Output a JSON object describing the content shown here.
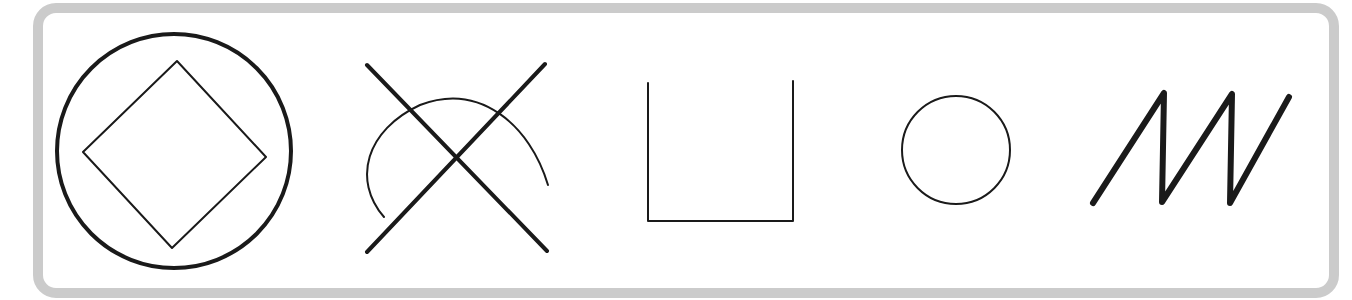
{
  "figure": {
    "colors": {
      "frame": "#cbcbcb",
      "stroke": "#1a1a1a",
      "background": "#ffffff"
    },
    "frame": {
      "x": 38,
      "y": 8,
      "width": 1296,
      "height": 285,
      "radius": 18
    },
    "symbols": [
      {
        "name": "circle-with-diamond",
        "circle": {
          "cx": 174,
          "cy": 151,
          "r": 117,
          "stroke_width": 4
        },
        "diamond": {
          "points": "177,61 266,157 172,248 83,152",
          "stroke_width": 2
        }
      },
      {
        "name": "x-with-arc",
        "lines": [
          {
            "x1": 367,
            "y1": 65,
            "x2": 547,
            "y2": 251
          },
          {
            "x1": 545,
            "y1": 64,
            "x2": 367,
            "y2": 252
          }
        ],
        "line_stroke_width": 4,
        "arc": {
          "d": "M384,217 C352,180 366,130 420,105 C480,82 530,125 548,185",
          "stroke_width": 2
        }
      },
      {
        "name": "open-square-u",
        "path": "M648,83 L648,221 L793,221 L793,81",
        "stroke_width": 2
      },
      {
        "name": "small-circle",
        "circle": {
          "cx": 956,
          "cy": 150,
          "r": 54,
          "stroke_width": 2
        }
      },
      {
        "name": "zigzag",
        "points": "1093,203 1164,93 1162,202 1232,94 1230,203 1289,97",
        "stroke_width": 6
      }
    ]
  }
}
